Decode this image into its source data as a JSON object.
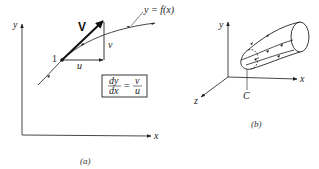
{
  "figure_a": {
    "caption": "(a)",
    "axes": {
      "x_label": "x",
      "y_label": "y"
    },
    "curve_label": "y = f(x)",
    "point_label": "1",
    "vector_label": "V",
    "u_label": "u",
    "v_label": "v",
    "equation": {
      "lhs_num": "dy",
      "lhs_den": "dx",
      "equals": "=",
      "rhs_num": "v",
      "rhs_den": "u"
    }
  },
  "figure_b": {
    "caption": "(b)",
    "axes": {
      "x_label": "x",
      "y_label": "y",
      "z_label": "z"
    },
    "curve_label": "C"
  },
  "colors": {
    "ink": "#222222",
    "background": "#ffffff"
  }
}
